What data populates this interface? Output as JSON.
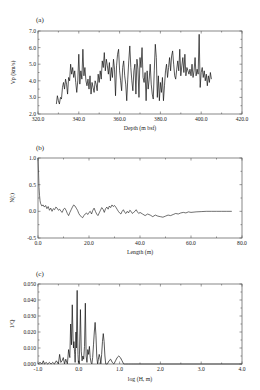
{
  "chart_data": [
    {
      "id": "a",
      "type": "line",
      "panel_label": "(a)",
      "title": "",
      "xlabel": "Depth (m bsf)",
      "ylabel": "Vp (km/s)",
      "xlim": [
        320,
        420
      ],
      "ylim": [
        2.0,
        7.0
      ],
      "xticks": [
        320,
        340,
        360,
        380,
        400,
        420
      ],
      "xtick_labels": [
        "320.0",
        "340.0",
        "360.0",
        "380.0",
        "400.0",
        "420.0"
      ],
      "yticks": [
        2,
        3,
        4,
        5,
        6,
        7
      ],
      "ytick_labels": [
        "2.0",
        "3.0",
        "4.0",
        "5.0",
        "6.0",
        "7.0"
      ],
      "grid": false,
      "box": {
        "x0": 38,
        "x1": 242,
        "y0": 31,
        "y1": 114
      },
      "stroke_width": 0.7,
      "x": [
        329.0,
        329.5,
        330.0,
        330.5,
        331.0,
        331.5,
        332.0,
        332.5,
        333.0,
        333.5,
        334.0,
        334.5,
        335.0,
        335.5,
        336.0,
        336.5,
        337.0,
        337.5,
        338.0,
        338.5,
        339.0,
        339.5,
        340.0,
        340.5,
        341.0,
        341.5,
        342.0,
        342.5,
        343.0,
        343.5,
        344.0,
        344.5,
        345.0,
        345.5,
        346.0,
        346.5,
        347.0,
        347.5,
        348.0,
        348.5,
        349.0,
        349.5,
        350.0,
        350.5,
        351.0,
        351.5,
        352.0,
        352.5,
        353.0,
        353.5,
        354.0,
        354.5,
        355.0,
        355.5,
        356.0,
        356.5,
        357.0,
        357.5,
        358.0,
        358.5,
        359.0,
        359.5,
        360.0,
        360.5,
        361.0,
        361.5,
        362.0,
        362.5,
        363.0,
        363.5,
        364.0,
        364.5,
        365.0,
        365.5,
        366.0,
        366.5,
        367.0,
        367.5,
        368.0,
        368.5,
        369.0,
        369.5,
        370.0,
        370.5,
        371.0,
        371.5,
        372.0,
        372.5,
        373.0,
        373.5,
        374.0,
        374.5,
        375.0,
        375.5,
        376.0,
        376.5,
        377.0,
        377.5,
        378.0,
        378.5,
        379.0,
        379.5,
        380.0,
        380.5,
        381.0,
        381.5,
        382.0,
        382.5,
        383.0,
        383.5,
        384.0,
        384.5,
        385.0,
        385.5,
        386.0,
        386.5,
        387.0,
        387.5,
        388.0,
        388.5,
        389.0,
        389.5,
        390.0,
        390.5,
        391.0,
        391.5,
        392.0,
        392.5,
        393.0,
        393.5,
        394.0,
        394.5,
        395.0,
        395.5,
        396.0,
        396.5,
        397.0,
        397.5,
        398.0,
        398.5,
        399.0,
        399.5,
        400.0,
        400.5,
        401.0,
        401.5,
        402.0,
        402.5,
        403.0,
        403.5,
        404.0,
        404.5,
        405.0
      ],
      "values": [
        2.6,
        3.1,
        2.8,
        2.6,
        3.0,
        2.9,
        3.6,
        3.9,
        3.5,
        4.1,
        3.8,
        3.2,
        4.2,
        4.0,
        5.0,
        4.4,
        4.8,
        4.2,
        4.6,
        3.9,
        3.3,
        4.0,
        5.6,
        3.8,
        4.6,
        4.1,
        5.9,
        4.3,
        4.8,
        4.0,
        3.7,
        4.1,
        3.5,
        4.3,
        3.2,
        3.9,
        3.6,
        3.3,
        4.0,
        3.8,
        3.4,
        4.4,
        3.9,
        4.6,
        4.1,
        5.2,
        4.8,
        5.7,
        4.6,
        5.3,
        4.9,
        4.4,
        5.1,
        4.0,
        4.8,
        4.2,
        5.3,
        4.7,
        3.1,
        4.9,
        5.6,
        5.9,
        4.6,
        4.0,
        3.4,
        4.8,
        5.2,
        4.3,
        3.8,
        2.8,
        4.1,
        5.2,
        6.1,
        4.8,
        4.0,
        3.4,
        4.6,
        5.0,
        3.2,
        5.3,
        4.7,
        3.0,
        5.4,
        4.8,
        6.0,
        4.2,
        3.9,
        4.5,
        2.8,
        4.6,
        3.5,
        4.1,
        5.0,
        3.8,
        3.2,
        2.9,
        4.6,
        6.2,
        5.4,
        3.0,
        4.3,
        2.8,
        3.9,
        3.3,
        4.2,
        2.8,
        3.7,
        4.6,
        5.0,
        4.2,
        4.8,
        5.4,
        4.6,
        5.5,
        5.8,
        5.0,
        4.3,
        4.1,
        4.7,
        5.2,
        4.6,
        5.9,
        4.3,
        4.9,
        5.4,
        4.5,
        5.6,
        4.3,
        4.8,
        4.6,
        4.4,
        4.7,
        4.3,
        5.0,
        4.2,
        4.6,
        5.4,
        4.3,
        4.7,
        4.4,
        6.8,
        3.6,
        4.5,
        4.8,
        4.2,
        4.6,
        4.0,
        4.4,
        3.7,
        4.3,
        3.9,
        4.5,
        4.1,
        4.5,
        4.7,
        5.0,
        5.6,
        4.6,
        4.8,
        4.5
      ]
    },
    {
      "id": "b",
      "type": "line",
      "panel_label": "(b)",
      "title": "",
      "xlabel": "Length (m)",
      "ylabel": "N(t)",
      "xlim": [
        0,
        80
      ],
      "ylim": [
        -0.5,
        1.0
      ],
      "xticks": [
        0,
        20,
        40,
        60,
        80
      ],
      "xtick_labels": [
        "0.0",
        "20.0",
        "40.0",
        "60.0",
        "80.0"
      ],
      "yticks": [
        -0.5,
        0.0,
        0.5,
        1.0
      ],
      "ytick_labels": [
        "-0.5",
        "0.0",
        "0.5",
        "1.0"
      ],
      "grid": false,
      "box": {
        "x0": 38,
        "x1": 242,
        "y0": 158,
        "y1": 238
      },
      "stroke_width": 0.6,
      "x": [
        0.0,
        0.2,
        0.4,
        0.6,
        0.8,
        1.0,
        1.5,
        2.0,
        2.5,
        3.0,
        3.5,
        4.0,
        4.5,
        5.0,
        5.5,
        6.0,
        6.5,
        7.0,
        7.5,
        8.0,
        8.5,
        9.0,
        9.5,
        10.0,
        10.5,
        11.0,
        11.5,
        12.0,
        12.5,
        13.0,
        13.5,
        14.0,
        14.5,
        15.0,
        15.5,
        16.0,
        16.5,
        17.0,
        17.5,
        18.0,
        18.5,
        19.0,
        19.5,
        20.0,
        20.5,
        21.0,
        21.5,
        22.0,
        22.5,
        23.0,
        23.5,
        24.0,
        24.5,
        25.0,
        25.5,
        26.0,
        26.5,
        27.0,
        27.5,
        28.0,
        28.5,
        29.0,
        29.5,
        30.0,
        30.5,
        31.0,
        31.5,
        32.0,
        32.5,
        33.0,
        33.5,
        34.0,
        34.5,
        35.0,
        35.5,
        36.0,
        36.5,
        37.0,
        37.5,
        38.0,
        38.5,
        39.0,
        39.5,
        40.0,
        41.0,
        42.0,
        43.0,
        44.0,
        45.0,
        46.0,
        47.0,
        48.0,
        49.0,
        50.0,
        51.0,
        52.0,
        53.0,
        54.0,
        55.0,
        56.0,
        57.0,
        58.0,
        59.0,
        60.0,
        62.0,
        64.0,
        66.0,
        68.0,
        70.0,
        72.0,
        74.0,
        76.0
      ],
      "values": [
        1.0,
        0.75,
        0.45,
        0.3,
        0.2,
        0.15,
        0.1,
        0.12,
        0.08,
        0.11,
        0.05,
        0.09,
        0.02,
        0.06,
        0.0,
        0.05,
        0.03,
        0.08,
        0.06,
        0.02,
        0.04,
        0.0,
        -0.02,
        0.04,
        0.06,
        0.02,
        -0.04,
        -0.08,
        -0.02,
        0.03,
        0.08,
        0.12,
        0.1,
        0.06,
        0.02,
        -0.04,
        -0.08,
        -0.1,
        -0.12,
        -0.08,
        -0.05,
        -0.03,
        -0.06,
        -0.02,
        0.0,
        -0.05,
        0.02,
        0.06,
        0.0,
        -0.05,
        -0.08,
        -0.03,
        0.02,
        0.07,
        0.04,
        -0.02,
        0.05,
        0.08,
        0.04,
        0.1,
        0.07,
        0.12,
        0.09,
        0.11,
        0.08,
        0.04,
        0.0,
        -0.03,
        -0.05,
        0.0,
        0.03,
        -0.02,
        -0.04,
        0.0,
        -0.03,
        0.02,
        0.0,
        -0.04,
        -0.02,
        0.0,
        0.03,
        -0.01,
        -0.04,
        -0.02,
        -0.05,
        -0.08,
        -0.05,
        -0.07,
        -0.1,
        -0.07,
        -0.09,
        -0.1,
        -0.11,
        -0.09,
        -0.07,
        -0.08,
        -0.06,
        -0.04,
        -0.05,
        -0.03,
        -0.02,
        -0.03,
        -0.01,
        -0.02,
        -0.01,
        -0.005,
        0.0,
        0.0,
        0.0,
        0.0,
        0.0,
        0.0
      ]
    },
    {
      "id": "c",
      "type": "line",
      "panel_label": "(c)",
      "title": "",
      "xlabel": "log (H, m)",
      "ylabel": "1/Q",
      "xlim": [
        -1.0,
        4.0
      ],
      "ylim": [
        0.0,
        0.05
      ],
      "xticks": [
        -1,
        0,
        1,
        2,
        3,
        4
      ],
      "xtick_labels": [
        "-1.0",
        "0.0",
        "1.0",
        "2.0",
        "3.0",
        "4.0"
      ],
      "yticks": [
        0.0,
        0.01,
        0.02,
        0.03,
        0.04,
        0.05
      ],
      "ytick_labels": [
        "0.000",
        "0.010",
        "0.020",
        "0.030",
        "0.040",
        "0.050"
      ],
      "grid": false,
      "box": {
        "x0": 38,
        "x1": 242,
        "y0": 284,
        "y1": 364
      },
      "stroke_width": 0.7,
      "x": [
        -1.0,
        -0.95,
        -0.9,
        -0.87,
        -0.84,
        -0.8,
        -0.76,
        -0.72,
        -0.68,
        -0.64,
        -0.6,
        -0.55,
        -0.5,
        -0.47,
        -0.44,
        -0.41,
        -0.38,
        -0.35,
        -0.32,
        -0.28,
        -0.25,
        -0.22,
        -0.2,
        -0.18,
        -0.16,
        -0.14,
        -0.13,
        -0.12,
        -0.11,
        -0.1,
        -0.09,
        -0.08,
        -0.07,
        -0.06,
        -0.05,
        -0.04,
        -0.03,
        -0.02,
        -0.01,
        0.0,
        0.01,
        0.02,
        0.04,
        0.06,
        0.08,
        0.1,
        0.12,
        0.14,
        0.16,
        0.18,
        0.2,
        0.22,
        0.24,
        0.26,
        0.28,
        0.3,
        0.32,
        0.34,
        0.36,
        0.38,
        0.4,
        0.42,
        0.44,
        0.46,
        0.48,
        0.5,
        0.52,
        0.54,
        0.56,
        0.58,
        0.6,
        0.62,
        0.64,
        0.66,
        0.7,
        0.74,
        0.78,
        0.82,
        0.86,
        0.9,
        0.94,
        0.98,
        1.02,
        1.06,
        1.1,
        1.14,
        1.18,
        1.22,
        1.26,
        1.3,
        1.35,
        1.4,
        1.45,
        1.5,
        1.55,
        1.6,
        2.0,
        2.5,
        3.0,
        3.5,
        4.0
      ],
      "values": [
        0.0,
        0.001,
        0.0,
        0.002,
        0.0,
        0.001,
        0.0,
        0.001,
        0.0,
        0.001,
        0.0,
        0.002,
        0.0,
        0.006,
        0.001,
        0.002,
        0.004,
        0.0,
        0.003,
        0.0,
        0.009,
        0.004,
        0.025,
        0.012,
        0.037,
        0.015,
        0.01,
        0.014,
        0.01,
        0.006,
        0.001,
        0.008,
        0.02,
        0.01,
        0.03,
        0.046,
        0.02,
        0.006,
        0.001,
        0.002,
        0.0,
        0.01,
        0.034,
        0.008,
        0.002,
        0.005,
        0.003,
        0.011,
        0.038,
        0.005,
        0.001,
        0.009,
        0.006,
        0.011,
        0.004,
        0.001,
        0.0,
        0.004,
        0.012,
        0.02,
        0.026,
        0.018,
        0.005,
        0.0,
        0.003,
        0.006,
        0.004,
        0.0,
        0.006,
        0.014,
        0.019,
        0.014,
        0.005,
        0.0,
        0.0,
        0.002,
        0.003,
        0.001,
        0.0,
        0.002,
        0.004,
        0.005,
        0.004,
        0.002,
        0.0,
        0.0,
        0.0,
        0.0,
        0.0,
        0.0,
        0.0,
        0.0,
        0.0,
        0.0,
        0.0,
        0.0,
        0.0,
        0.0,
        0.0,
        0.0,
        0.0
      ]
    }
  ]
}
